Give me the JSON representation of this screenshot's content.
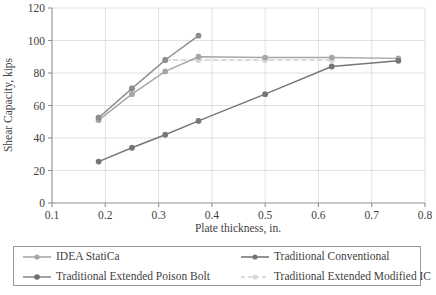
{
  "chart_data": {
    "type": "line",
    "title": "",
    "xlabel": "Plate thickness, in.",
    "ylabel": "Shear Capacity, kips",
    "xlim": [
      0.1,
      0.8
    ],
    "ylim": [
      0,
      120
    ],
    "xticks": [
      "0.1",
      "0.2",
      "0.3",
      "0.4",
      "0.5",
      "0.6",
      "0.7",
      "0.8"
    ],
    "xtick_values": [
      0.1,
      0.2,
      0.3,
      0.4,
      0.5,
      0.6,
      0.7,
      0.8
    ],
    "yticks": [
      "0",
      "20",
      "40",
      "60",
      "80",
      "100",
      "120"
    ],
    "ytick_values": [
      0,
      20,
      40,
      60,
      80,
      100,
      120
    ],
    "grid": true,
    "grid_axis": "both",
    "legend_position": "below",
    "series": [
      {
        "name": "IDEA StatiCa",
        "color": "#a6a6a6",
        "dash": "solid",
        "marker": "circle",
        "x": [
          0.1875,
          0.25,
          0.3125,
          0.375,
          0.5,
          0.625,
          0.75
        ],
        "values": [
          51,
          67,
          81,
          90,
          89.5,
          89.5,
          89
        ]
      },
      {
        "name": "Traditional Conventional",
        "color": "#767676",
        "dash": "solid",
        "marker": "circle",
        "x": [
          0.1875,
          0.25,
          0.3125,
          0.375,
          0.5,
          0.625,
          0.75
        ],
        "values": [
          25.5,
          34,
          42,
          50.5,
          67,
          84,
          87.5
        ]
      },
      {
        "name": "Traditional Extended Poison Bolt",
        "color": "#8c8c8c",
        "dash": "solid",
        "marker": "circle",
        "x": [
          0.1875,
          0.25,
          0.3125,
          0.375
        ],
        "values": [
          52.5,
          70.5,
          88,
          103
        ]
      },
      {
        "name": "Traditional Extended Modified IC",
        "color": "#d0d0d0",
        "dash": "dashed",
        "marker": "circle",
        "x": [
          0.1875,
          0.25,
          0.3125,
          0.375,
          0.5,
          0.625
        ],
        "values": [
          52.5,
          70.5,
          88,
          88,
          88,
          88
        ]
      }
    ]
  },
  "axes": {
    "x_title": "Plate thickness, in.",
    "y_title": "Shear Capacity, kips",
    "x_tick_labels": [
      "0.1",
      "0.2",
      "0.3",
      "0.4",
      "0.5",
      "0.6",
      "0.7",
      "0.8"
    ],
    "y_tick_labels": [
      "0",
      "20",
      "40",
      "60",
      "80",
      "100",
      "120"
    ]
  },
  "legend": {
    "items": [
      {
        "label": "IDEA StatiCa",
        "color": "#a6a6a6",
        "dash": "solid"
      },
      {
        "label": "Traditional Conventional",
        "color": "#767676",
        "dash": "solid"
      },
      {
        "label": "Traditional Extended Poison Bolt",
        "color": "#8c8c8c",
        "dash": "solid"
      },
      {
        "label": "Traditional Extended Modified IC",
        "color": "#d0d0d0",
        "dash": "dashed"
      }
    ]
  },
  "colors": {
    "axis": "#8f8f8f",
    "grid": "#d9d9d9",
    "text": "#3f3f3f",
    "legend_border": "#9a9a9a",
    "background": "#ffffff"
  }
}
